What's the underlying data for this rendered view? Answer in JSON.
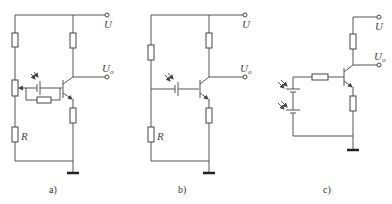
{
  "figure": {
    "panels": [
      {
        "id": "a",
        "caption": "a)",
        "labels": {
          "supply": "U",
          "output": "U",
          "output_sub": "o",
          "resistor": "R"
        },
        "components": [
          "resistor-top",
          "potentiometer",
          "resistor-R",
          "photocell",
          "feedback-resistor",
          "npn-transistor",
          "collector-resistor",
          "emitter-resistor",
          "ground"
        ]
      },
      {
        "id": "b",
        "caption": "b)",
        "labels": {
          "supply": "U",
          "output": "U",
          "output_sub": "o",
          "resistor": "R"
        },
        "components": [
          "resistor-top",
          "resistor-R",
          "photocell",
          "npn-transistor",
          "collector-resistor",
          "emitter-resistor",
          "ground"
        ]
      },
      {
        "id": "c",
        "caption": "c)",
        "labels": {
          "supply": "U",
          "output": "U",
          "output_sub": "o"
        },
        "components": [
          "photocell-1",
          "photocell-2",
          "base-resistor",
          "npn-transistor",
          "collector-resistor",
          "emitter-resistor",
          "ground"
        ]
      }
    ]
  }
}
